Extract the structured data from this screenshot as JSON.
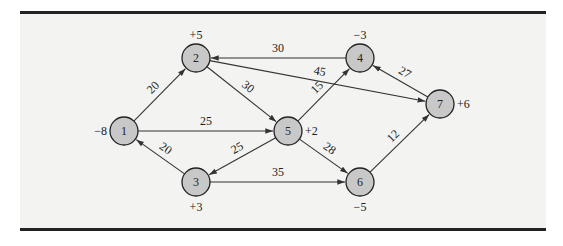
{
  "diagram": {
    "type": "directed network flow (min-cost transshipment)",
    "nodes": [
      {
        "id": "1",
        "label": "1",
        "supply": "−8",
        "x": 124,
        "y": 131,
        "supply_pos": "left"
      },
      {
        "id": "2",
        "label": "2",
        "supply": "+5",
        "x": 196,
        "y": 58,
        "supply_pos": "top"
      },
      {
        "id": "3",
        "label": "3",
        "supply": "+3",
        "x": 196,
        "y": 182,
        "supply_pos": "bottom"
      },
      {
        "id": "4",
        "label": "4",
        "supply": "−3",
        "x": 360,
        "y": 58,
        "supply_pos": "top"
      },
      {
        "id": "5",
        "label": "5",
        "supply": "+2",
        "x": 288,
        "y": 131,
        "supply_pos": "right"
      },
      {
        "id": "6",
        "label": "6",
        "supply": "−5",
        "x": 360,
        "y": 182,
        "supply_pos": "bottom"
      },
      {
        "id": "7",
        "label": "7",
        "supply": "+6",
        "x": 440,
        "y": 104,
        "supply_pos": "right"
      }
    ],
    "edges": [
      {
        "from": "1",
        "to": "2",
        "weight": "20"
      },
      {
        "from": "1",
        "to": "5",
        "weight": "25"
      },
      {
        "from": "3",
        "to": "1",
        "weight": "20"
      },
      {
        "from": "2",
        "to": "5",
        "weight": "30"
      },
      {
        "from": "2",
        "to": "7",
        "weight": "45"
      },
      {
        "from": "4",
        "to": "2",
        "weight": "30"
      },
      {
        "from": "5",
        "to": "3",
        "weight": "25"
      },
      {
        "from": "5",
        "to": "4",
        "weight": "15"
      },
      {
        "from": "5",
        "to": "6",
        "weight": "28"
      },
      {
        "from": "3",
        "to": "6",
        "weight": "35"
      },
      {
        "from": "7",
        "to": "4",
        "weight": "27"
      },
      {
        "from": "6",
        "to": "7",
        "weight": "12"
      }
    ]
  }
}
